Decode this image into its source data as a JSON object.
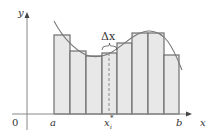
{
  "figure": {
    "axis_labels": {
      "x": "x",
      "y": "y",
      "origin": "0"
    },
    "tick_labels": {
      "a": "a",
      "b": "b",
      "sample_point": "x",
      "sample_point_sub": "i",
      "sample_point_sup": "*"
    },
    "delta_label": "Δx",
    "colors": {
      "rect_fill": "#e8e8e8",
      "rect_stroke": "#6e6e6e",
      "curve": "#777777",
      "axis": "#888888"
    },
    "rectangles": [
      {
        "x0": 54,
        "x1": 70,
        "top": 35
      },
      {
        "x0": 70,
        "x1": 86,
        "top": 51
      },
      {
        "x0": 86,
        "x1": 102,
        "top": 56
      },
      {
        "x0": 102,
        "x1": 117,
        "top": 53
      },
      {
        "x0": 117,
        "x1": 132,
        "top": 43
      },
      {
        "x0": 132,
        "x1": 148,
        "top": 33
      },
      {
        "x0": 148,
        "x1": 164,
        "top": 33
      },
      {
        "x0": 164,
        "x1": 179,
        "top": 55
      }
    ]
  }
}
